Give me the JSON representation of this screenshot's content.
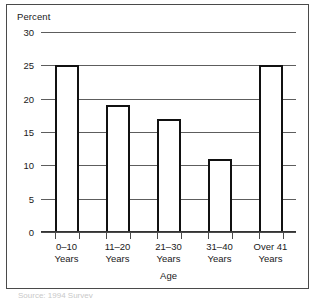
{
  "chart_data": {
    "type": "bar",
    "title": "",
    "subtitle": "",
    "xlabel": "Age",
    "ylabel": "Percent",
    "categories": [
      "0–10\nYears",
      "11–20\nYears",
      "21–30\nYears",
      "31–40\nYears",
      "Over 41\nYears"
    ],
    "category_lines": [
      [
        "0–10",
        "Years"
      ],
      [
        "11–20",
        "Years"
      ],
      [
        "21–30",
        "Years"
      ],
      [
        "31–40",
        "Years"
      ],
      [
        "Over 41",
        "Years"
      ]
    ],
    "values": [
      25,
      19,
      17,
      11,
      25
    ],
    "ylim": [
      0,
      30
    ],
    "yticks": [
      0,
      5,
      10,
      15,
      20,
      25,
      30
    ],
    "ytick_labels": [
      "0",
      "5",
      "10",
      "15",
      "20",
      "25",
      "30"
    ],
    "grid": true,
    "grid_axis": "y",
    "legend": false,
    "legend_position": "none",
    "bar_fill_color": "#ffffff",
    "bar_edge_color": "#111111",
    "gridline_color": "#5d5d5d",
    "axis_color": "#333333",
    "text_color": "#1a1a1a"
  },
  "axes": {
    "y_title": "Percent",
    "x_title": "Age"
  },
  "caption": {
    "sliver_text": "Source: 1994 Survey"
  }
}
